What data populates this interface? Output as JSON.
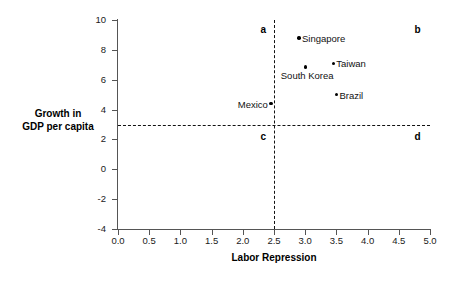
{
  "chart_data": {
    "type": "scatter",
    "title": "",
    "xlabel": "Labor Repression",
    "ylabel_line1": "Growth in",
    "ylabel_line2": "GDP per capita",
    "xlim": [
      0.0,
      5.0
    ],
    "ylim": [
      -4,
      10
    ],
    "grid": false,
    "legend": "none",
    "xticks": [
      "0.0",
      "0.5",
      "1.0",
      "1.5",
      "2.0",
      "2.5",
      "3.0",
      "3.5",
      "4.0",
      "4.5",
      "5.0"
    ],
    "xtick_values": [
      0.0,
      0.5,
      1.0,
      1.5,
      2.0,
      2.5,
      3.0,
      3.5,
      4.0,
      4.5,
      5.0
    ],
    "yticks": [
      "10",
      "8",
      "6",
      "4",
      "2",
      "0",
      "-2",
      "-4"
    ],
    "ytick_values": [
      10,
      8,
      6,
      4,
      2,
      0,
      -2,
      -4
    ],
    "points": [
      {
        "label": "Singapore",
        "x": 2.9,
        "y": 8.8,
        "label_side": "right"
      },
      {
        "label": "Taiwan",
        "x": 3.45,
        "y": 7.1,
        "label_side": "right"
      },
      {
        "label": "South Korea",
        "x": 3.0,
        "y": 6.85,
        "label_side": "below"
      },
      {
        "label": "Brazil",
        "x": 3.5,
        "y": 5.0,
        "label_side": "right"
      },
      {
        "label": "Mexico",
        "x": 2.45,
        "y": 4.4,
        "label_side": "left"
      }
    ],
    "reference_lines": [
      {
        "name": "vertical-threshold",
        "orientation": "vertical",
        "value": 2.5,
        "style": "dashed"
      },
      {
        "name": "horizontal-threshold",
        "orientation": "horizontal",
        "value": 3.0,
        "style": "dashed"
      }
    ],
    "quadrant_labels": [
      {
        "key": "a",
        "text": "a",
        "x": 2.33,
        "y": 9.4
      },
      {
        "key": "b",
        "text": "b",
        "x": 4.8,
        "y": 9.4
      },
      {
        "key": "c",
        "text": "c",
        "x": 2.33,
        "y": 2.2
      },
      {
        "key": "d",
        "text": "d",
        "x": 4.8,
        "y": 2.2
      }
    ]
  }
}
